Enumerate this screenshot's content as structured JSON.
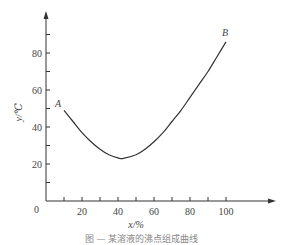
{
  "chart_data": {
    "type": "line",
    "title": "",
    "xlabel": "x/%",
    "ylabel": "y/℃",
    "xlim": [
      0,
      120
    ],
    "ylim": [
      0,
      100
    ],
    "x_ticks": [
      0,
      20,
      40,
      60,
      80,
      100
    ],
    "x_minor_ticks": [
      10,
      30,
      50,
      70,
      90
    ],
    "y_ticks": [
      0,
      20,
      40,
      60,
      80
    ],
    "y_minor_ticks": [
      10,
      30,
      50,
      70,
      90
    ],
    "grid": false,
    "legend": null,
    "series": [
      {
        "name": "curve A-B",
        "x": [
          10,
          15,
          20,
          25,
          30,
          35,
          40,
          43,
          50,
          55,
          60,
          65,
          70,
          75,
          80,
          85,
          90,
          95,
          100
        ],
        "y": [
          49,
          43,
          37,
          32,
          28,
          25,
          23.3,
          23,
          25,
          28,
          32,
          37,
          43,
          49,
          56,
          63,
          70,
          78,
          86
        ]
      }
    ],
    "annotations": [
      {
        "text": "A",
        "x": 10,
        "y": 49
      },
      {
        "text": "B",
        "x": 100,
        "y": 86
      }
    ]
  },
  "labels": {
    "x_axis_title": "x/%",
    "y_axis_title": "y/℃",
    "point_a": "A",
    "point_b": "B",
    "origin": "0",
    "caption": "图 — 某溶液的沸点组成曲线"
  }
}
